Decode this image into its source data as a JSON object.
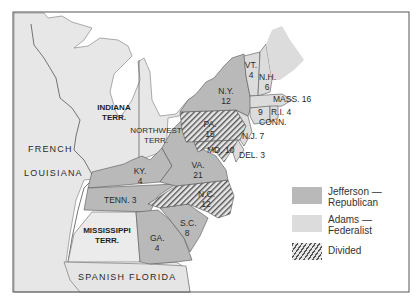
{
  "map": {
    "subject": "Presidential election of 1800 — electoral votes by state",
    "colors": {
      "jefferson": "#b9b9b9",
      "adams": "#dcdcdc",
      "territory": "#e9e9e9",
      "water": "#ffffff",
      "border": "#555555"
    },
    "regions": {
      "indiana": "INDIANA\nTERR.",
      "northwest": "NORTHWEST\nTERR.",
      "french": "FRENCH",
      "louisiana": "LOUISIANA",
      "mississippi": "MISSISSIPPI\nTERR.",
      "florida": "SPANISH FLORIDA"
    },
    "states": {
      "vt": {
        "name": "VT.",
        "votes": "4"
      },
      "nh": {
        "name": "N.H.",
        "votes": "6"
      },
      "ny": {
        "name": "N.Y.",
        "votes": "12"
      },
      "mass": {
        "name": "MASS. 16"
      },
      "conn": {
        "name": "CONN.",
        "votes": "9"
      },
      "ri": {
        "name": "R.I. 4"
      },
      "pa": {
        "name": "PA.",
        "votes": "15"
      },
      "nj": {
        "name": "N.J. 7"
      },
      "md": {
        "name": "MD. 10"
      },
      "del": {
        "name": "DEL. 3"
      },
      "va": {
        "name": "VA.",
        "votes": "21"
      },
      "ky": {
        "name": "KY.",
        "votes": "4"
      },
      "tenn": {
        "name": "TENN. 3"
      },
      "nc": {
        "name": "N.C.",
        "votes": "12"
      },
      "sc": {
        "name": "S.C.",
        "votes": "8"
      },
      "ga": {
        "name": "GA.",
        "votes": "4"
      }
    },
    "legend": [
      {
        "key": "jefferson",
        "label_line1": "Jefferson —",
        "label_line2": "Republican"
      },
      {
        "key": "adams",
        "label_line1": "Adams —",
        "label_line2": "Federalist"
      },
      {
        "key": "divided",
        "label_line1": "Divided",
        "label_line2": ""
      }
    ]
  }
}
